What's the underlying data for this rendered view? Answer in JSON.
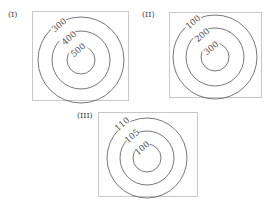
{
  "figures": [
    {
      "label": "(I)",
      "contours": [
        "300",
        "400",
        "500"
      ]
    },
    {
      "label": "(II)",
      "contours": [
        "100",
        "200",
        "300"
      ]
    },
    {
      "label": "(III)",
      "contours": [
        "110",
        "105",
        "100"
      ]
    }
  ]
}
